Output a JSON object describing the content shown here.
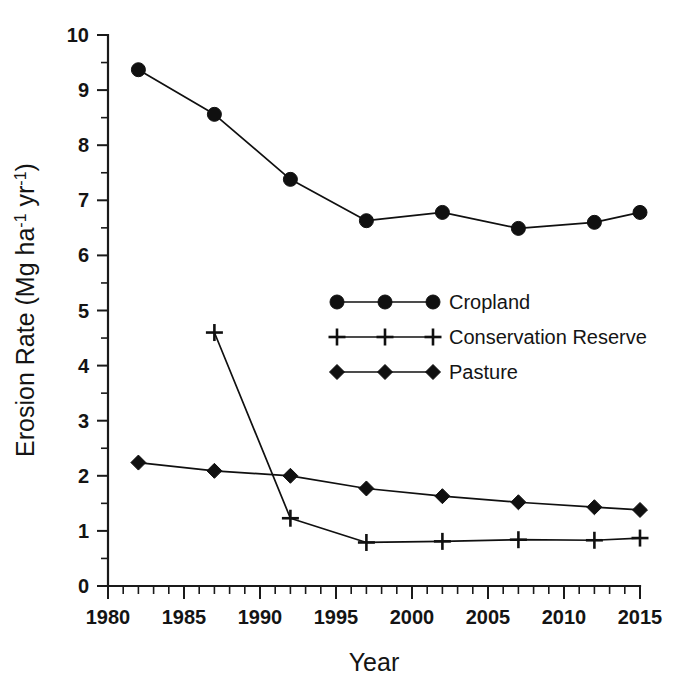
{
  "chart_data": {
    "type": "line",
    "title": "",
    "xlabel": "Year",
    "ylabel": "Erosion Rate (Mg ha⁻¹ yr⁻¹)",
    "ylabel_parts": {
      "prefix": "Erosion Rate (Mg ha",
      "sup1": "-1",
      "middle": " yr",
      "sup2": "-1",
      "suffix": ")"
    },
    "xlim": [
      1980,
      2015
    ],
    "ylim": [
      0,
      10
    ],
    "grid": false,
    "legend_position": "center-right",
    "x_major_ticks": [
      1980,
      1985,
      1990,
      1995,
      2000,
      2005,
      2010,
      2015
    ],
    "x_minor_interval": 1,
    "y_major_ticks": [
      0,
      1,
      2,
      3,
      4,
      5,
      6,
      7,
      8,
      9,
      10
    ],
    "y_minor_interval": 0.5,
    "x_tick_labels": [
      "1980",
      "1985",
      "1990",
      "1995",
      "2000",
      "2005",
      "2010",
      "2015"
    ],
    "y_tick_labels": [
      "0",
      "1",
      "2",
      "3",
      "4",
      "5",
      "6",
      "7",
      "8",
      "9",
      "10"
    ],
    "series": [
      {
        "name": "Cropland",
        "marker": "circle",
        "color": "#101010",
        "x": [
          1982,
          1987,
          1992,
          1997,
          2002,
          2007,
          2012,
          2015
        ],
        "values": [
          9.37,
          8.56,
          7.38,
          6.63,
          6.78,
          6.49,
          6.6,
          6.78
        ]
      },
      {
        "name": "Conservation Reserve",
        "marker": "plus",
        "color": "#101010",
        "x": [
          1987,
          1992,
          1997,
          2002,
          2007,
          2012,
          2015
        ],
        "values": [
          4.6,
          1.23,
          0.79,
          0.81,
          0.84,
          0.83,
          0.87
        ]
      },
      {
        "name": "Pasture",
        "marker": "diamond",
        "color": "#101010",
        "x": [
          1982,
          1987,
          1992,
          1997,
          2002,
          2007,
          2012,
          2015
        ],
        "values": [
          2.24,
          2.09,
          2.0,
          1.77,
          1.63,
          1.52,
          1.43,
          1.38
        ]
      }
    ]
  },
  "legend": {
    "items": [
      {
        "label": "Cropland",
        "marker": "circle"
      },
      {
        "label": "Conservation Reserve",
        "marker": "plus"
      },
      {
        "label": "Pasture",
        "marker": "diamond"
      }
    ]
  },
  "colors": {
    "foreground": "#101010",
    "background": "#ffffff"
  }
}
